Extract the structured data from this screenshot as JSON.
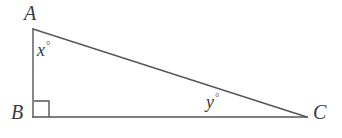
{
  "figure": {
    "kind": "right-triangle",
    "background_color": "#ffffff",
    "stroke_color": "#555555",
    "text_color": "#3a3a3a",
    "stroke_width": 1.4,
    "vertices": {
      "A": {
        "label": "A",
        "x": 33,
        "y": 29
      },
      "B": {
        "label": "B",
        "x": 33,
        "y": 117
      },
      "C": {
        "label": "C",
        "x": 307,
        "y": 117
      }
    },
    "sides": [
      {
        "name": "AB",
        "from": "A",
        "to": "B"
      },
      {
        "name": "BC",
        "from": "B",
        "to": "C"
      },
      {
        "name": "AC",
        "from": "A",
        "to": "C"
      }
    ],
    "angles": [
      {
        "at": "A",
        "label": "x",
        "degree_symbol": "°"
      },
      {
        "at": "B",
        "label": "",
        "degree_symbol": "",
        "marker": "right-angle-square"
      },
      {
        "at": "C",
        "label": "y",
        "degree_symbol": "°"
      }
    ],
    "right_angle_marker": {
      "x": 34,
      "y": 101,
      "size": 15
    }
  },
  "labels": {
    "vertex_a": "A",
    "vertex_b": "B",
    "vertex_c": "C",
    "angle_x": "x",
    "angle_y": "y",
    "degree_symbol": "°"
  }
}
